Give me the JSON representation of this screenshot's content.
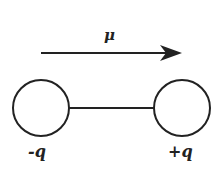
{
  "diagram": {
    "dipole_moment_label": "μ",
    "negative_charge_label": "-q",
    "positive_charge_label": "+q",
    "arrow_direction": "right",
    "colors": {
      "stroke": "#222222",
      "fill": "#ffffff"
    }
  }
}
